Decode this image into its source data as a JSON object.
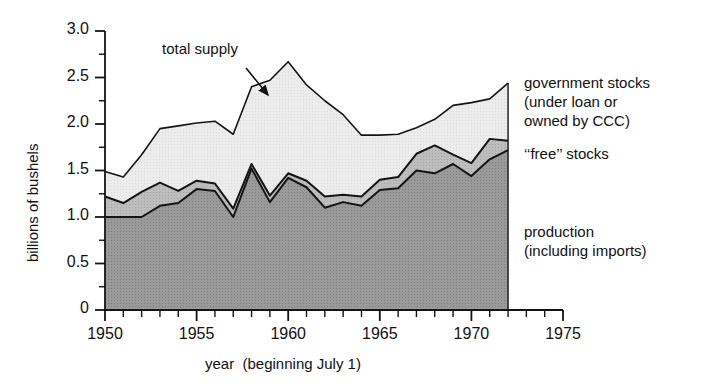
{
  "chart_data": {
    "type": "area",
    "title": "",
    "subtitle": "",
    "xlabel": "year  (beginning July 1)",
    "ylabel": "billions of bushels",
    "xlim": [
      1950,
      1975
    ],
    "ylim": [
      0,
      3.0
    ],
    "grid": false,
    "legend_position": "right-inline",
    "stacked": true,
    "x": [
      1950,
      1951,
      1952,
      1953,
      1954,
      1955,
      1956,
      1957,
      1958,
      1959,
      1960,
      1961,
      1962,
      1963,
      1964,
      1965,
      1966,
      1967,
      1968,
      1969,
      1970,
      1971,
      1972
    ],
    "x_tick_labels": [
      "1950",
      "1955",
      "1960",
      "1965",
      "1970",
      "1975"
    ],
    "x_major_ticks": [
      1950,
      1955,
      1960,
      1965,
      1970,
      1975
    ],
    "x_minor_tick_interval": 1,
    "y_tick_labels": [
      "0",
      "0.5",
      "1.0",
      "1.5",
      "2.0",
      "2.5",
      "3.0"
    ],
    "y_major_ticks": [
      0,
      0.5,
      1.0,
      1.5,
      2.0,
      2.5,
      3.0
    ],
    "y_minor_tick_interval": 0.25,
    "series": [
      {
        "name": "production (including imports)",
        "color": "#8f8f8f",
        "values": [
          1.0,
          1.0,
          1.0,
          1.12,
          1.15,
          1.3,
          1.28,
          1.0,
          1.52,
          1.16,
          1.42,
          1.32,
          1.1,
          1.16,
          1.12,
          1.29,
          1.31,
          1.5,
          1.47,
          1.57,
          1.44,
          1.62,
          1.72
        ]
      },
      {
        "name": "‘‘free’’ stocks",
        "color": "#b5b5b5",
        "values": [
          0.22,
          0.15,
          0.27,
          0.25,
          0.13,
          0.09,
          0.08,
          0.09,
          0.05,
          0.07,
          0.05,
          0.07,
          0.12,
          0.08,
          0.1,
          0.11,
          0.12,
          0.18,
          0.3,
          0.1,
          0.14,
          0.22,
          0.1
        ]
      },
      {
        "name": "government stocks (under loan or owned by CCC)",
        "color": "#e6e6e6",
        "values": [
          0.27,
          0.28,
          0.4,
          0.58,
          0.7,
          0.62,
          0.67,
          0.8,
          0.83,
          1.24,
          1.2,
          1.03,
          1.03,
          0.86,
          0.66,
          0.48,
          0.46,
          0.28,
          0.28,
          0.53,
          0.65,
          0.43,
          0.62
        ]
      }
    ],
    "total_line_name": "total supply",
    "total_values": [
      1.49,
      1.43,
      1.67,
      1.95,
      1.98,
      2.01,
      2.03,
      1.89,
      2.4,
      2.47,
      2.67,
      2.42,
      2.25,
      2.1,
      1.88,
      1.88,
      1.89,
      1.96,
      2.05,
      2.2,
      2.23,
      2.27,
      2.44
    ],
    "annotations": [
      {
        "name": "total-supply",
        "text": "total supply",
        "x_pct": 23.0,
        "y_pct": 11.0
      }
    ]
  },
  "axis": {
    "y_title": "billions of bushels",
    "x_title": "year  (beginning July 1)"
  },
  "legend": {
    "government_stocks": "government stocks\n(under loan or\nowned by CCC)",
    "free_stocks": "‘‘free’’ stocks",
    "production": "production\n(including imports)"
  },
  "icons": {
    "arrow": "annotation-arrow-icon"
  }
}
